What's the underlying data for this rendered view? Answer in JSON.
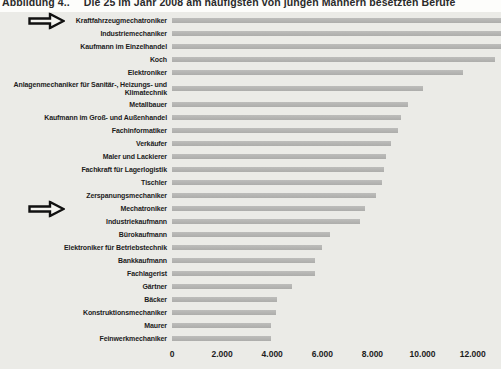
{
  "figure": {
    "label": "Abbildung 4..",
    "title": "Die 25 im Jahr 2008 am häufigsten von jungen Männern besetzten Berufe"
  },
  "chart_data": {
    "type": "bar",
    "orientation": "horizontal",
    "title": "Die 25 im Jahr 2008 am häufigsten von jungen Männern besetzten Berufe",
    "xlabel": "",
    "ylabel": "",
    "grid": false,
    "legend": null,
    "xlim": [
      0,
      13130
    ],
    "x_ticks": [
      "0",
      "2.000",
      "4.000",
      "6.000",
      "8.000",
      "10.000",
      "12.000"
    ],
    "x_tick_values": [
      0,
      2000,
      4000,
      6000,
      8000,
      10000,
      12000
    ],
    "bar_color": "#b3b3b1",
    "panel_background": "#ebebe7",
    "categories": [
      "Kraftfahrzeugmechatroniker",
      "Industriemechaniker",
      "Kaufmann im Einzelhandel",
      "Koch",
      "Elektroniker",
      "Anlagenmechaniker für Sanitär-, Heizungs- und Klimatechnik",
      "Metallbauer",
      "Kaufmann im Groß- und Außenhandel",
      "Fachinformatiker",
      "Verkäufer",
      "Maler und Lackierer",
      "Fachkraft für Lagerlogistik",
      "Tischler",
      "Zerspanungsmechaniker",
      "Mechatroniker",
      "Industriekaufmann",
      "Bürokaufmann",
      "Elektroniker für Betriebstechnik",
      "Bankkaufmann",
      "Fachlagerist",
      "Gärtner",
      "Bäcker",
      "Konstruktionsmechaniker",
      "Maurer",
      "Feinwerkmechaniker"
    ],
    "values": [
      13130,
      13130,
      13130,
      12900,
      11600,
      10000,
      9400,
      9150,
      9000,
      8750,
      8550,
      8450,
      8400,
      8150,
      7700,
      7500,
      6300,
      6000,
      5700,
      5700,
      4800,
      4200,
      4150,
      3950,
      3950
    ],
    "clipped_rows": [
      0,
      1,
      2
    ],
    "clipped_note": "Top three bars run off the right edge of the image; values at edge ≈ 13.100",
    "arrow_rows": [
      0,
      14
    ],
    "arrow_marked_categories": [
      "Kraftfahrzeugmechatroniker",
      "Mechatroniker"
    ]
  }
}
